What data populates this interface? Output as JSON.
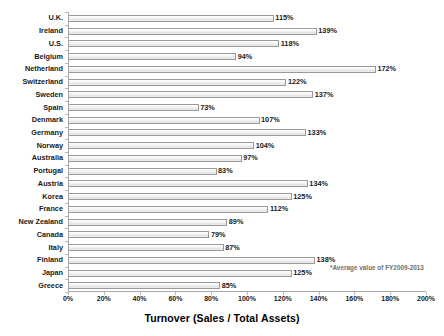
{
  "chart_data": {
    "type": "bar",
    "orientation": "horizontal",
    "title": "",
    "xlabel": "Turnover  (Sales / Total Assets)",
    "ylabel": "",
    "xlim": [
      0,
      200
    ],
    "xunit": "%",
    "grid": false,
    "legend": null,
    "xticks": [
      "0%",
      "20%",
      "40%",
      "60%",
      "80%",
      "100%",
      "120%",
      "140%",
      "160%",
      "180%",
      "200%"
    ],
    "xtick_values": [
      0,
      20,
      40,
      60,
      80,
      100,
      120,
      140,
      160,
      180,
      200
    ],
    "categories": [
      "U.K.",
      "Ireland",
      "U.S.",
      "Belgium",
      "Netherland",
      "Switzerland",
      "Sweden",
      "Spain",
      "Denmark",
      "Germany",
      "Norway",
      "Australia",
      "Portugal",
      "Austria",
      "Korea",
      "France",
      "New Zealand",
      "Canada",
      "Italy",
      "Finland",
      "Japan",
      "Greece"
    ],
    "values": [
      115,
      139,
      118,
      94,
      172,
      122,
      137,
      73,
      107,
      133,
      104,
      97,
      83,
      134,
      125,
      112,
      89,
      79,
      87,
      138,
      125,
      85
    ],
    "value_labels": [
      "115%",
      "139%",
      "118%",
      "94%",
      "172%",
      "122%",
      "137%",
      "73%",
      "107%",
      "133%",
      "104%",
      "97%",
      "83%",
      "134%",
      "125%",
      "112%",
      "89%",
      "79%",
      "87%",
      "138%",
      "125%",
      "85%"
    ],
    "annotations": [
      "*Average value of FY2009-2013"
    ],
    "colors": {
      "bar_fill": "#f0f0f0",
      "bar_border": "#9a9a9a",
      "axis": "#a8a8a8",
      "text": "#1a1a1a",
      "footnote": "#6f6f6f"
    }
  },
  "footnote": "*Average value of FY2009-2013"
}
